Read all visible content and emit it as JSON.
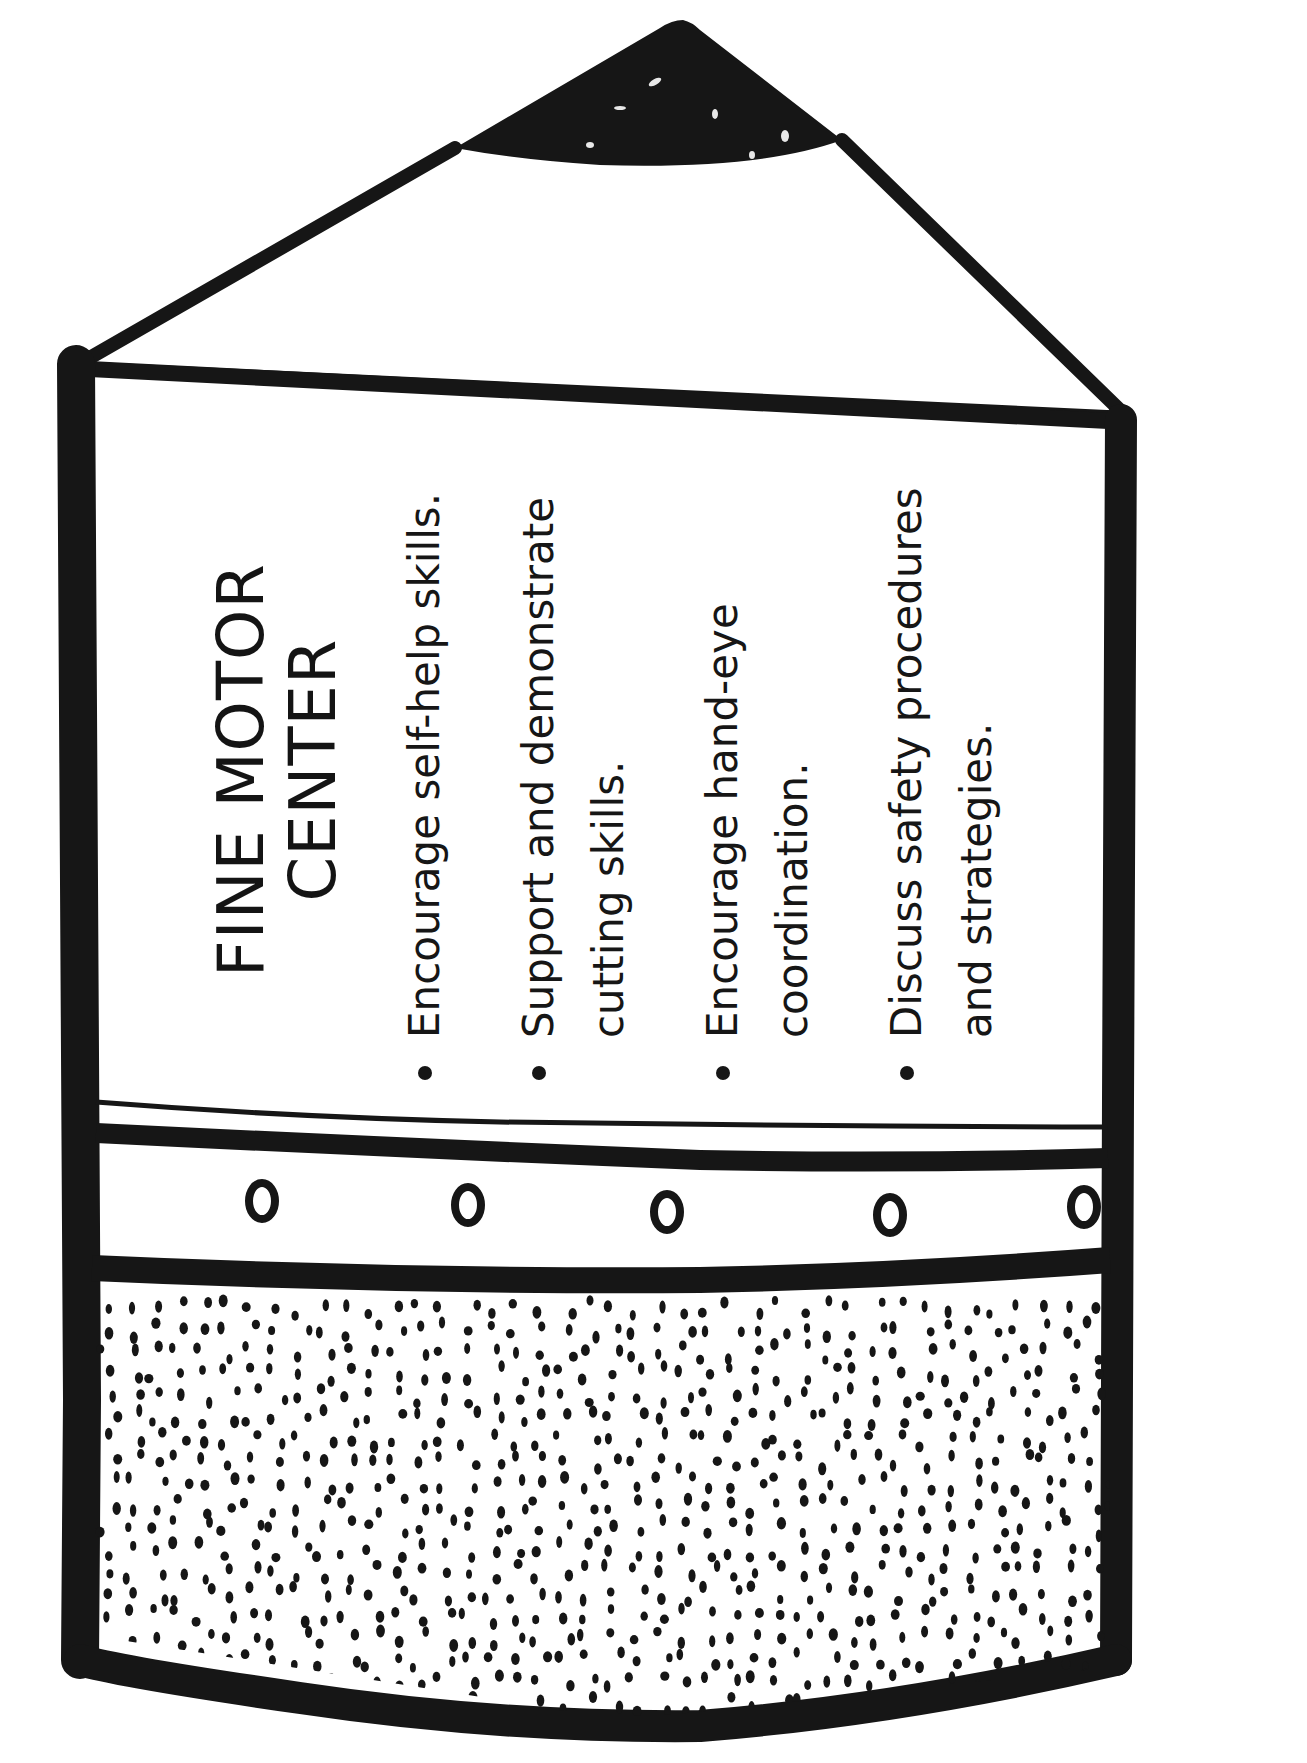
{
  "document": {
    "shape": "pencil",
    "orientation": "rotated-90-ccw",
    "colors": {
      "ink": "#161616",
      "paper": "#ffffff"
    },
    "title": {
      "line1": "FINE MOTOR",
      "line2": "CENTER"
    },
    "bullets": [
      {
        "lines": [
          "Encourage self-help skills."
        ]
      },
      {
        "lines": [
          "Support and demonstrate",
          "cutting skills."
        ]
      },
      {
        "lines": [
          "Encourage hand-eye",
          "coordination."
        ]
      },
      {
        "lines": [
          "Discuss safety procedures",
          "and strategies."
        ]
      }
    ],
    "ferrule_circles": 5,
    "eraser_pattern": "stippled-dots"
  }
}
